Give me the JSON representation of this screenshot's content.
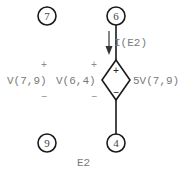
{
  "diagram": {
    "element_name": "E2",
    "nodes": [
      {
        "id": "7",
        "label": "7"
      },
      {
        "id": "6",
        "label": "6"
      },
      {
        "id": "9",
        "label": "9"
      },
      {
        "id": "4",
        "label": "4"
      }
    ],
    "source": {
      "type": "voltage-controlled-voltage-source",
      "expression": "5V(7,9)",
      "plus_sign": "+",
      "minus_sign": "−"
    },
    "current_label": "I(E2)",
    "voltage_labels": [
      {
        "label": "V(7,9)",
        "plus": "+",
        "minus": "−"
      },
      {
        "label": "V(6,4)",
        "plus": "+",
        "minus": "−"
      }
    ],
    "colors": {
      "wire": "#1a1a1a",
      "label_text": "#7a7a7a",
      "background": "#ffffff"
    }
  }
}
